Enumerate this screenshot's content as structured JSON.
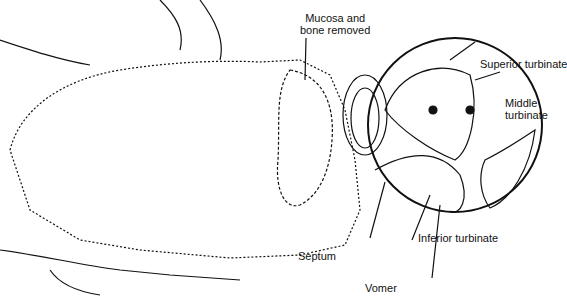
{
  "figure": {
    "labels": {
      "mucosa": [
        "Mucosa and",
        "bone removed"
      ],
      "superior_turbinate": "Superior turbinate",
      "middle_turbinate": [
        "Middle",
        "turbinate"
      ],
      "inferior_turbinate": "Inferior turbinate",
      "septum": "Septum",
      "vomer": "Vomer"
    },
    "colors": {
      "ink": "#111111",
      "background": "#ffffff"
    }
  }
}
